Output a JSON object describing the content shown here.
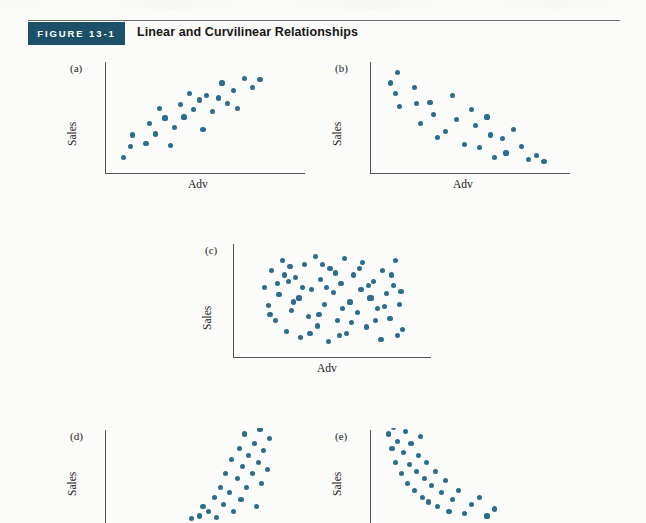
{
  "figure": {
    "badge_label": "Figure 13-1",
    "title": "Linear and Curvilinear Relationships",
    "badge_color": "#1c5068",
    "dot_color": "#2b6d8f",
    "axis_color": "#555555",
    "page_background": "#fbfbf9"
  },
  "panels": [
    {
      "letter": "(a)",
      "ylabel": "Sales",
      "xlabel": "Adv",
      "relationship": "positive linear"
    },
    {
      "letter": "(b)",
      "ylabel": "Sales",
      "xlabel": "Adv",
      "relationship": "negative linear"
    },
    {
      "letter": "(c)",
      "ylabel": "Sales",
      "xlabel": "Adv",
      "relationship": "no relationship"
    },
    {
      "letter": "(d)",
      "ylabel": "Sales",
      "xlabel": "",
      "relationship": "curvilinear increasing"
    },
    {
      "letter": "(e)",
      "ylabel": "Sales",
      "xlabel": "",
      "relationship": "curvilinear decreasing"
    }
  ],
  "chart_data": [
    {
      "type": "scatter",
      "panel": "(a)",
      "title": "",
      "xlabel": "Adv",
      "ylabel": "Sales",
      "xlim": [
        0,
        100
      ],
      "ylim": [
        0,
        100
      ],
      "grid": false,
      "legend": null,
      "points": [
        [
          8,
          12
        ],
        [
          12,
          22
        ],
        [
          13,
          33
        ],
        [
          20,
          25
        ],
        [
          22,
          44
        ],
        [
          25,
          34
        ],
        [
          27,
          58
        ],
        [
          30,
          49
        ],
        [
          33,
          23
        ],
        [
          35,
          40
        ],
        [
          38,
          62
        ],
        [
          40,
          50
        ],
        [
          43,
          72
        ],
        [
          45,
          57
        ],
        [
          48,
          66
        ],
        [
          50,
          38
        ],
        [
          52,
          70
        ],
        [
          55,
          55
        ],
        [
          58,
          68
        ],
        [
          60,
          82
        ],
        [
          63,
          63
        ],
        [
          66,
          75
        ],
        [
          68,
          58
        ],
        [
          72,
          86
        ],
        [
          76,
          78
        ],
        [
          80,
          85
        ]
      ]
    },
    {
      "type": "scatter",
      "panel": "(b)",
      "title": "",
      "xlabel": "Adv",
      "ylabel": "Sales",
      "xlim": [
        0,
        100
      ],
      "ylim": [
        0,
        100
      ],
      "grid": false,
      "legend": null,
      "points": [
        [
          9,
          82
        ],
        [
          13,
          92
        ],
        [
          12,
          72
        ],
        [
          14,
          60
        ],
        [
          22,
          78
        ],
        [
          23,
          63
        ],
        [
          25,
          44
        ],
        [
          30,
          64
        ],
        [
          32,
          52
        ],
        [
          34,
          31
        ],
        [
          38,
          36
        ],
        [
          42,
          70
        ],
        [
          44,
          48
        ],
        [
          48,
          24
        ],
        [
          52,
          57
        ],
        [
          54,
          42
        ],
        [
          56,
          21
        ],
        [
          60,
          50
        ],
        [
          62,
          33
        ],
        [
          64,
          12
        ],
        [
          68,
          30
        ],
        [
          70,
          16
        ],
        [
          74,
          38
        ],
        [
          78,
          22
        ],
        [
          82,
          10
        ],
        [
          86,
          14
        ],
        [
          90,
          8
        ]
      ]
    },
    {
      "type": "scatter",
      "panel": "(c)",
      "title": "",
      "xlabel": "Adv",
      "ylabel": "Sales",
      "xlim": [
        0,
        100
      ],
      "ylim": [
        0,
        100
      ],
      "grid": false,
      "legend": null,
      "points": [
        [
          14,
          62
        ],
        [
          16,
          45
        ],
        [
          18,
          78
        ],
        [
          20,
          30
        ],
        [
          22,
          55
        ],
        [
          24,
          88
        ],
        [
          26,
          20
        ],
        [
          27,
          68
        ],
        [
          29,
          40
        ],
        [
          31,
          72
        ],
        [
          33,
          52
        ],
        [
          34,
          14
        ],
        [
          36,
          84
        ],
        [
          38,
          34
        ],
        [
          40,
          60
        ],
        [
          42,
          92
        ],
        [
          43,
          25
        ],
        [
          45,
          70
        ],
        [
          47,
          46
        ],
        [
          49,
          10
        ],
        [
          50,
          80
        ],
        [
          52,
          57
        ],
        [
          54,
          30
        ],
        [
          56,
          66
        ],
        [
          58,
          90
        ],
        [
          59,
          18
        ],
        [
          61,
          48
        ],
        [
          63,
          74
        ],
        [
          65,
          38
        ],
        [
          67,
          60
        ],
        [
          68,
          86
        ],
        [
          70,
          24
        ],
        [
          72,
          52
        ],
        [
          74,
          68
        ],
        [
          76,
          42
        ],
        [
          78,
          12
        ],
        [
          79,
          78
        ],
        [
          81,
          56
        ],
        [
          83,
          32
        ],
        [
          85,
          64
        ],
        [
          86,
          88
        ],
        [
          88,
          46
        ],
        [
          90,
          22
        ],
        [
          17,
          36
        ],
        [
          21,
          66
        ],
        [
          28,
          82
        ],
        [
          35,
          62
        ],
        [
          39,
          18
        ],
        [
          44,
          36
        ],
        [
          48,
          62
        ],
        [
          53,
          76
        ],
        [
          57,
          42
        ],
        [
          62,
          28
        ],
        [
          66,
          80
        ],
        [
          71,
          64
        ],
        [
          75,
          30
        ],
        [
          80,
          44
        ],
        [
          84,
          74
        ],
        [
          87,
          16
        ],
        [
          89,
          58
        ],
        [
          25,
          74
        ],
        [
          30,
          48
        ],
        [
          46,
          84
        ],
        [
          55,
          16
        ],
        [
          73,
          52
        ]
      ]
    },
    {
      "type": "scatter",
      "panel": "(d)",
      "title": "",
      "xlabel": "",
      "ylabel": "Sales",
      "xlim": [
        0,
        100
      ],
      "ylim": [
        0,
        100
      ],
      "grid": false,
      "legend": null,
      "note": "cropped at bottom edge of page",
      "points": [
        [
          44,
          4
        ],
        [
          48,
          6
        ],
        [
          50,
          14
        ],
        [
          53,
          10
        ],
        [
          56,
          22
        ],
        [
          57,
          5
        ],
        [
          59,
          30
        ],
        [
          61,
          16
        ],
        [
          62,
          42
        ],
        [
          64,
          26
        ],
        [
          65,
          54
        ],
        [
          66,
          10
        ],
        [
          68,
          38
        ],
        [
          69,
          64
        ],
        [
          70,
          20
        ],
        [
          71,
          48
        ],
        [
          72,
          76
        ],
        [
          73,
          30
        ],
        [
          74,
          58
        ],
        [
          75,
          86
        ],
        [
          76,
          42
        ],
        [
          77,
          68
        ],
        [
          78,
          14
        ],
        [
          79,
          52
        ],
        [
          80,
          80
        ],
        [
          81,
          34
        ],
        [
          82,
          62
        ],
        [
          83,
          90
        ],
        [
          84,
          46
        ],
        [
          85,
          72
        ]
      ]
    },
    {
      "type": "scatter",
      "panel": "(e)",
      "title": "",
      "xlabel": "",
      "ylabel": "Sales",
      "xlim": [
        0,
        100
      ],
      "ylim": [
        0,
        100
      ],
      "grid": false,
      "legend": null,
      "note": "cropped at bottom edge of page",
      "points": [
        [
          6,
          88
        ],
        [
          8,
          76
        ],
        [
          9,
          92
        ],
        [
          10,
          64
        ],
        [
          11,
          82
        ],
        [
          12,
          52
        ],
        [
          13,
          70
        ],
        [
          14,
          90
        ],
        [
          15,
          42
        ],
        [
          16,
          60
        ],
        [
          17,
          78
        ],
        [
          18,
          34
        ],
        [
          19,
          50
        ],
        [
          20,
          68
        ],
        [
          21,
          86
        ],
        [
          22,
          28
        ],
        [
          23,
          44
        ],
        [
          24,
          58
        ],
        [
          25,
          74
        ],
        [
          26,
          22
        ],
        [
          27,
          38
        ],
        [
          28,
          52
        ],
        [
          29,
          18
        ],
        [
          31,
          32
        ],
        [
          33,
          44
        ],
        [
          34,
          14
        ],
        [
          36,
          26
        ],
        [
          38,
          36
        ],
        [
          40,
          10
        ],
        [
          42,
          20
        ],
        [
          45,
          28
        ],
        [
          48,
          8
        ],
        [
          52,
          16
        ],
        [
          56,
          22
        ],
        [
          60,
          6
        ],
        [
          64,
          12
        ]
      ]
    }
  ]
}
